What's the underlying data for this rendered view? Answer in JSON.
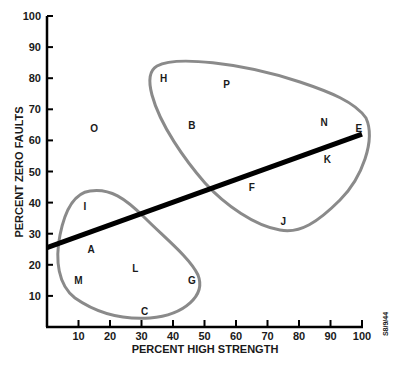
{
  "chart_data": {
    "type": "scatter",
    "title": "",
    "xlabel": "PERCENT HIGH STRENGTH",
    "ylabel": "PERCENT ZERO FAULTS",
    "xlim": [
      0,
      100
    ],
    "ylim": [
      0,
      100
    ],
    "x_ticks": [
      10,
      20,
      30,
      40,
      50,
      60,
      70,
      80,
      90,
      100
    ],
    "y_ticks": [
      10,
      20,
      30,
      40,
      50,
      60,
      70,
      80,
      90,
      100
    ],
    "grid": false,
    "legend": null,
    "annotation": "S8/9/44",
    "points": [
      {
        "label": "H",
        "x": 37,
        "y": 80
      },
      {
        "label": "P",
        "x": 57,
        "y": 78
      },
      {
        "label": "O",
        "x": 15,
        "y": 64
      },
      {
        "label": "B",
        "x": 46,
        "y": 65
      },
      {
        "label": "N",
        "x": 88,
        "y": 66
      },
      {
        "label": "E",
        "x": 99,
        "y": 64
      },
      {
        "label": "K",
        "x": 89,
        "y": 54
      },
      {
        "label": "F",
        "x": 65,
        "y": 45
      },
      {
        "label": "I",
        "x": 12,
        "y": 39
      },
      {
        "label": "J",
        "x": 75,
        "y": 34
      },
      {
        "label": "A",
        "x": 14,
        "y": 25
      },
      {
        "label": "L",
        "x": 28,
        "y": 19
      },
      {
        "label": "M",
        "x": 10,
        "y": 15
      },
      {
        "label": "G",
        "x": 46,
        "y": 15
      },
      {
        "label": "C",
        "x": 31,
        "y": 5
      }
    ],
    "trend_line": {
      "x": [
        0,
        100
      ],
      "y": [
        25.5,
        62
      ]
    },
    "clusters": [
      {
        "name": "upper-right-cluster",
        "members": [
          "H",
          "P",
          "B",
          "N",
          "E",
          "K",
          "F",
          "J"
        ]
      },
      {
        "name": "lower-left-cluster",
        "members": [
          "I",
          "A",
          "L",
          "M",
          "G",
          "C"
        ]
      }
    ]
  }
}
